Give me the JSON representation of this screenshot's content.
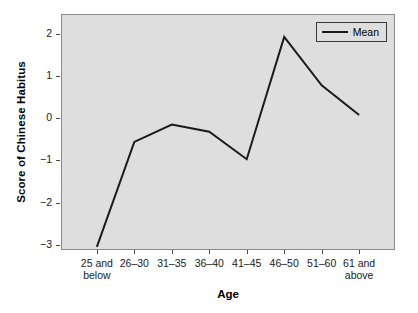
{
  "chart_data": {
    "type": "line",
    "title": "",
    "xlabel": "Age",
    "ylabel": "Score of Chinese Habitus",
    "categories": [
      "25 and\nbelow",
      "26–30",
      "31–35",
      "36–40",
      "41–45",
      "46–50",
      "51–60",
      "61 and\nabove"
    ],
    "series": [
      {
        "name": "Mean",
        "values": [
          -3.05,
          -0.56,
          -0.15,
          -0.32,
          -0.97,
          1.93,
          0.78,
          0.08
        ],
        "color": "#1a1a1a"
      }
    ],
    "ylim": [
      -3.1,
      2.45
    ],
    "yticks": [
      2,
      1,
      0,
      -1,
      -2,
      -3
    ],
    "ytick_labels": [
      "2",
      "1",
      "0",
      "−1",
      "−2",
      "−3"
    ],
    "grid": false,
    "legend_position": "top-right",
    "plot_background": "#dedede",
    "frame_color": "#8a8a8a"
  },
  "legend": {
    "entries": [
      {
        "label": "Mean"
      }
    ]
  },
  "axes": {
    "x_title": "Age",
    "y_title": "Score of Chinese Habitus"
  }
}
